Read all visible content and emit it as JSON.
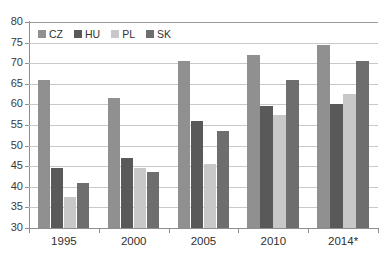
{
  "chart_data": {
    "type": "bar",
    "title": "",
    "subtitle": "",
    "xlabel": "",
    "ylabel": "",
    "categories": [
      "1995",
      "2000",
      "2005",
      "2010",
      "2014*"
    ],
    "ylim": [
      30,
      80
    ],
    "ytick_step": 5,
    "yticks": [
      "80",
      "75",
      "70",
      "65",
      "60",
      "55",
      "50",
      "45",
      "40",
      "35",
      "30"
    ],
    "grid": true,
    "legend_position": "top-left-inside",
    "series": [
      {
        "name": "CZ",
        "color": "#909090",
        "values": [
          66.0,
          61.5,
          70.5,
          72.0,
          74.5
        ]
      },
      {
        "name": "HU",
        "color": "#595959",
        "values": [
          44.5,
          47.0,
          56.0,
          59.5,
          60.0
        ]
      },
      {
        "name": "PL",
        "color": "#c8c8c8",
        "values": [
          37.5,
          44.5,
          45.5,
          57.5,
          62.5
        ]
      },
      {
        "name": "SK",
        "color": "#6e6e6e",
        "values": [
          41.0,
          43.5,
          53.5,
          66.0,
          70.5
        ]
      }
    ]
  },
  "colors": {
    "background": "#ffffff",
    "gridline": "#c9c9c9",
    "axis": "#8e8e8e",
    "tick_text": "#3a3a3a",
    "category_text": "#2f2f2f",
    "legend_text": "#333333"
  }
}
